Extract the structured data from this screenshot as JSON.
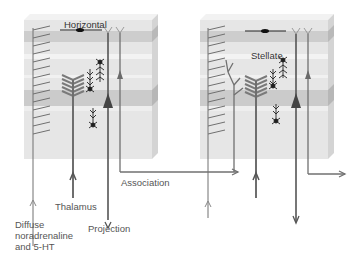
{
  "diagram": {
    "type": "cortical-column-connections",
    "colors": {
      "block_fill": "#e6e6e6",
      "band_fill": "#cfcfcf",
      "side_fill": "#d2d2d2",
      "top_fill": "#f0f0f0",
      "line": "#707070",
      "dark_line": "#555555",
      "black": "#111111"
    },
    "left_block": {
      "labels": {
        "horizontal": "Horizontal"
      }
    },
    "right_block": {
      "labels": {
        "stellate": "Stellate"
      }
    },
    "inputs_outputs": {
      "association": "Association",
      "thalamus": "Thalamus",
      "projection": "Projection",
      "diffuse": "Diffuse\nnoradrenaline\nand 5-HT"
    }
  }
}
